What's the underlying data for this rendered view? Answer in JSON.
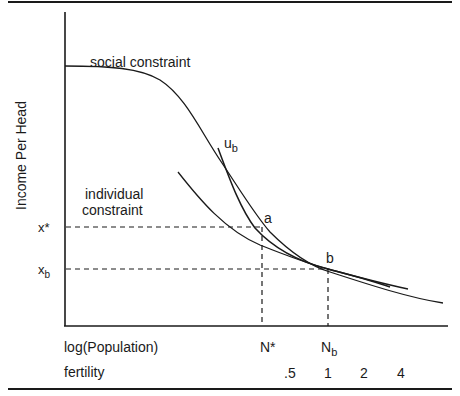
{
  "diagram": {
    "y_axis_label": "Income Per Head",
    "x_axis_label_1": "log(Population)",
    "x_axis_label_2": "fertility",
    "curves": {
      "social": "social constraint",
      "individual_line1": "individual",
      "individual_line2": "constraint",
      "utility": "u",
      "utility_sub": "b"
    },
    "points": {
      "a": "a",
      "b": "b"
    },
    "y_ticks": {
      "x_star": "x*",
      "x_b": "x",
      "x_b_sub": "b"
    },
    "x_ticks": {
      "n_star": "N*",
      "n_b": "N",
      "n_b_sub": "b"
    },
    "fertility_ticks": [
      ".5",
      "1",
      "2",
      "4"
    ],
    "colors": {
      "line": "#1a1a1a",
      "background": "#ffffff"
    }
  }
}
